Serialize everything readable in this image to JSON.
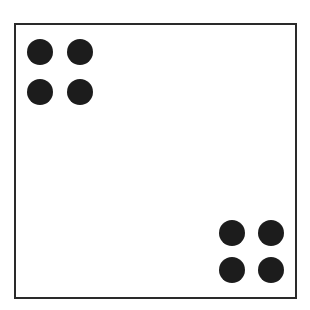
{
  "diagram": {
    "type": "dot-pattern",
    "frame": {
      "color": "#2a2a2a"
    },
    "dot_color": "#1c1c1c",
    "groups": [
      {
        "name": "top-left-cluster",
        "dots": [
          {
            "x": 40,
            "y": 52
          },
          {
            "x": 80,
            "y": 52
          },
          {
            "x": 40,
            "y": 92
          },
          {
            "x": 80,
            "y": 92
          }
        ]
      },
      {
        "name": "bottom-right-cluster",
        "dots": [
          {
            "x": 232,
            "y": 233
          },
          {
            "x": 271,
            "y": 233
          },
          {
            "x": 232,
            "y": 270
          },
          {
            "x": 271,
            "y": 270
          }
        ]
      }
    ],
    "total_dots": 8
  }
}
